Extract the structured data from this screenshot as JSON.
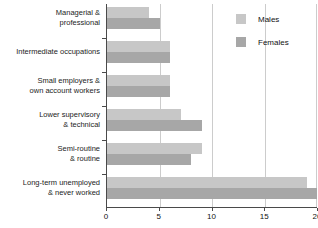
{
  "chart_data": {
    "type": "bar",
    "orientation": "horizontal",
    "categories": [
      "Managerial & professional",
      "Intermediate occupations",
      "Small employers & own account workers",
      "Lower supervisory & technical",
      "Semi-routine & routine",
      "Long-term unemployed & never worked"
    ],
    "category_lines": [
      [
        "Managerial &",
        "professional"
      ],
      [
        "Intermediate occupations"
      ],
      [
        "Small employers &",
        "own account workers"
      ],
      [
        "Lower supervisory",
        "& technical"
      ],
      [
        "Semi-routine",
        "& routine"
      ],
      [
        "Long-term unemployed",
        "& never worked"
      ]
    ],
    "series": [
      {
        "name": "Males",
        "color": "#c7c7c7",
        "values": [
          4,
          6,
          6,
          7,
          9,
          19
        ]
      },
      {
        "name": "Females",
        "color": "#a7a7a7",
        "values": [
          5,
          6,
          6,
          9,
          8,
          20
        ]
      }
    ],
    "xlim": [
      0,
      20
    ],
    "xticks": [
      0,
      5,
      10,
      15,
      20
    ],
    "grid": "vertical gridlines at x ticks",
    "legend_position": "top-right",
    "xlabel": "",
    "ylabel": "",
    "title": ""
  },
  "colors": {
    "background": "#ffffff",
    "axis": "#4a4a4a",
    "gridline": "#cccccc",
    "text": "#1c1c1c",
    "males_bar": "#c7c7c7",
    "females_bar": "#a7a7a7"
  }
}
